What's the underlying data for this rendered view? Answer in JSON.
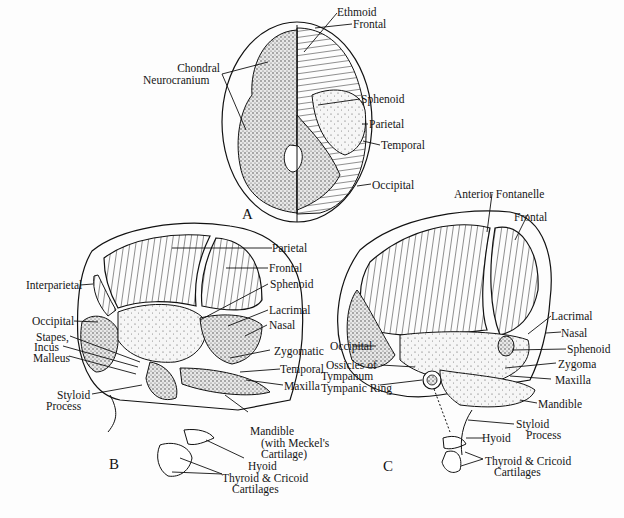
{
  "figure": {
    "panels": [
      {
        "id": "A",
        "label": "A",
        "labels": {
          "chondral": "Chondral",
          "neurocranium": "Neurocranium",
          "ethmoid": "Ethmoid",
          "frontal": "Frontal",
          "sphenoid": "Sphenoid",
          "parietal": "Parietal",
          "temporal": "Temporal",
          "occipital": "Occipital"
        }
      },
      {
        "id": "B",
        "label": "B",
        "labels": {
          "parietal": "Parietal",
          "frontal": "Frontal",
          "sphenoid": "Sphenoid",
          "interparietal": "Interparietal",
          "occipital": "Occipital",
          "stapes": "Stapes,",
          "incus": "Incus",
          "malleus": "Malleus",
          "lacrimal": "Lacrimal",
          "nasal": "Nasal",
          "zygomatic": "Zygomatic",
          "temporal": "Temporal",
          "maxilla": "Maxilla",
          "styloid": "Styloid",
          "process": "Process",
          "mandible": "Mandible",
          "meckel1": "(with Meckel's",
          "meckel2": "Cartilage)",
          "hyoid": "Hyoid",
          "thyroid": "Thyroid & Cricoid",
          "cartilages": "Cartilages"
        }
      },
      {
        "id": "C",
        "label": "C",
        "labels": {
          "anterior_fontanelle": "Anterior Fontanelle",
          "frontal": "Frontal",
          "occipital": "Occipital",
          "ossicles1": "Ossicles of",
          "ossicles2": "Tympanum",
          "tympanic_ring": "Tympanic Ring",
          "lacrimal": "Lacrimal",
          "nasal": "Nasal",
          "sphenoid": "Sphenoid",
          "zygoma": "Zygoma",
          "maxilla": "Maxilla",
          "mandible": "Mandible",
          "styloid": "Styloid",
          "process": "Process",
          "hyoid": "Hyoid",
          "thyroid": "Thyroid & Cricoid",
          "cartilages": "Cartilages"
        }
      }
    ]
  }
}
